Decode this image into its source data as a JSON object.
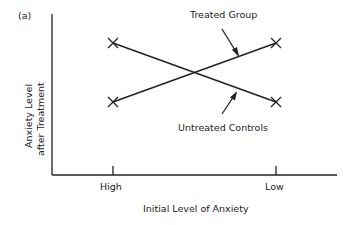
{
  "panel_label": "(a)",
  "diagram": {
    "type": "interaction line diagram",
    "x_axis_label": "Initial Level of Anxiety",
    "y_axis_label_line1": "Anxiety Level",
    "y_axis_label_line2": "after Treatment",
    "x_ticks": [
      "High",
      "Low"
    ],
    "series": [
      {
        "name": "Treated Group",
        "points": [
          {
            "x": "High",
            "y": "high"
          },
          {
            "x": "Low",
            "y": "low"
          }
        ],
        "label": "Treated Group"
      },
      {
        "name": "Untreated Controls",
        "points": [
          {
            "x": "High",
            "y": "low"
          },
          {
            "x": "Low",
            "y": "high"
          }
        ],
        "label": "Untreated Controls"
      }
    ],
    "marker": "x",
    "line_color": "#222222"
  }
}
